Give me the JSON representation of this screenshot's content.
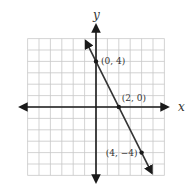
{
  "chart_data": {
    "type": "line",
    "title": "",
    "xlabel": "x",
    "ylabel": "y",
    "xlim": [
      -6,
      6
    ],
    "ylim": [
      -6,
      6
    ],
    "grid": true,
    "equation": "y = -2x + 4",
    "series": [
      {
        "name": "line",
        "x": [
          0,
          2,
          4
        ],
        "y": [
          4,
          0,
          -4
        ]
      }
    ],
    "points": [
      {
        "x": 0,
        "y": 4,
        "label": "(0, 4)"
      },
      {
        "x": 2,
        "y": 0,
        "label": "(2, 0)"
      },
      {
        "x": 4,
        "y": -4,
        "label": "(4, −4)"
      }
    ],
    "colors": {
      "grid": "#c8c8c8",
      "axis": "#1a1a1a",
      "line": "#333333"
    }
  }
}
